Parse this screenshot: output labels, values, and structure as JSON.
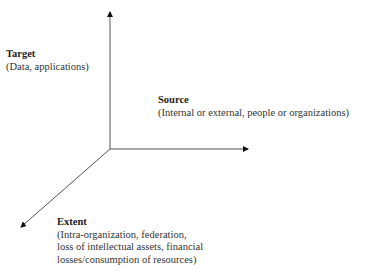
{
  "diagram": {
    "type": "3d-axes",
    "colors": {
      "background": "#ffffff",
      "axis_line": "#555555",
      "arrowhead": "#111111",
      "text": "#2a2a2a"
    },
    "axes": [
      {
        "id": "target",
        "direction": "up",
        "title": "Target",
        "description": "(Data, applications)"
      },
      {
        "id": "source",
        "direction": "right",
        "title": "Source",
        "description": "(Internal or external, people or organizations)"
      },
      {
        "id": "extent",
        "direction": "down-left",
        "title": "Extent",
        "description_lines": [
          "(Intra-organization, federation,",
          "loss of intellectual assets, financial",
          "losses/consumption of resources)"
        ]
      }
    ]
  }
}
